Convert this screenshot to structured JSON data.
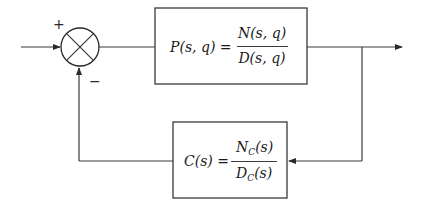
{
  "diagram": {
    "type": "feedback-control-block-diagram",
    "summing_junction": {
      "plus_sign": "+",
      "minus_sign": "−"
    },
    "plant_block": {
      "lhs": "P(s, q) =",
      "numerator": "N(s, q)",
      "denominator": "D(s, q)"
    },
    "controller_block": {
      "lhs": "C(s) =",
      "numerator_main": "N",
      "numerator_sub": "C",
      "numerator_arg": "(s)",
      "denominator_main": "D",
      "denominator_sub": "C",
      "denominator_arg": "(s)"
    },
    "stroke_color": "#3a3a3a"
  }
}
